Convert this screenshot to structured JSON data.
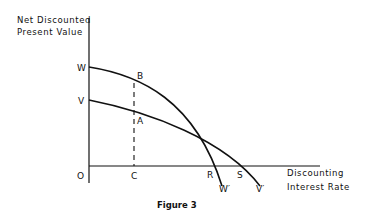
{
  "figure": {
    "caption": "Figure 3",
    "y_axis_label_line1": "Net Discounted",
    "y_axis_label_line2": "Present Value",
    "x_axis_label_line1": "Discounting",
    "x_axis_label_line2": "Interest Rate"
  },
  "points": {
    "origin": "O",
    "w": "W",
    "v": "V",
    "b": "B",
    "a": "A",
    "c": "C",
    "r": "R",
    "s": "S",
    "w_prime": "W′",
    "v_prime": "V′"
  },
  "curves": [
    {
      "name": "WW′",
      "start": "W",
      "end": "W′",
      "crosses_x_axis_at": "R"
    },
    {
      "name": "VV′",
      "start": "V",
      "end": "V′",
      "crosses_x_axis_at": "S"
    }
  ],
  "annotations": {
    "dashed_line": "Vertical dashed line from C through A to B"
  }
}
